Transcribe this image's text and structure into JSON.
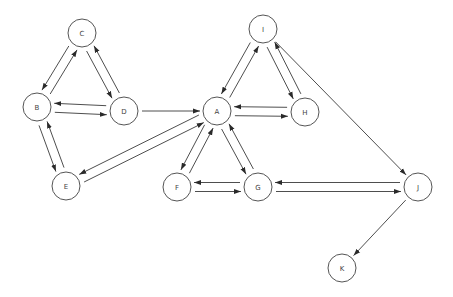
{
  "diagram": {
    "type": "directed-graph",
    "node_radius": 14,
    "nodes": [
      {
        "id": "A",
        "label": "A",
        "x": 217,
        "y": 111
      },
      {
        "id": "B",
        "label": "B",
        "x": 37,
        "y": 107
      },
      {
        "id": "C",
        "label": "C",
        "x": 82,
        "y": 33
      },
      {
        "id": "D",
        "label": "D",
        "x": 124,
        "y": 111
      },
      {
        "id": "E",
        "label": "E",
        "x": 66,
        "y": 186
      },
      {
        "id": "F",
        "label": "F",
        "x": 177,
        "y": 187
      },
      {
        "id": "G",
        "label": "G",
        "x": 258,
        "y": 187
      },
      {
        "id": "H",
        "label": "H",
        "x": 305,
        "y": 112
      },
      {
        "id": "I",
        "label": "I",
        "x": 263,
        "y": 29
      },
      {
        "id": "J",
        "label": "J",
        "x": 418,
        "y": 187
      },
      {
        "id": "K",
        "label": "K",
        "x": 342,
        "y": 268
      }
    ],
    "edges": [
      {
        "from": "C",
        "to": "B"
      },
      {
        "from": "B",
        "to": "C"
      },
      {
        "from": "C",
        "to": "D"
      },
      {
        "from": "D",
        "to": "C"
      },
      {
        "from": "B",
        "to": "D"
      },
      {
        "from": "D",
        "to": "B"
      },
      {
        "from": "B",
        "to": "E"
      },
      {
        "from": "E",
        "to": "B"
      },
      {
        "from": "D",
        "to": "A"
      },
      {
        "from": "E",
        "to": "A"
      },
      {
        "from": "A",
        "to": "E"
      },
      {
        "from": "I",
        "to": "A"
      },
      {
        "from": "A",
        "to": "I"
      },
      {
        "from": "I",
        "to": "H"
      },
      {
        "from": "H",
        "to": "I"
      },
      {
        "from": "A",
        "to": "H"
      },
      {
        "from": "H",
        "to": "A"
      },
      {
        "from": "A",
        "to": "F"
      },
      {
        "from": "F",
        "to": "A"
      },
      {
        "from": "A",
        "to": "G"
      },
      {
        "from": "G",
        "to": "A"
      },
      {
        "from": "F",
        "to": "G"
      },
      {
        "from": "G",
        "to": "F"
      },
      {
        "from": "G",
        "to": "J"
      },
      {
        "from": "J",
        "to": "G"
      },
      {
        "from": "I",
        "to": "J"
      },
      {
        "from": "J",
        "to": "K"
      }
    ]
  }
}
